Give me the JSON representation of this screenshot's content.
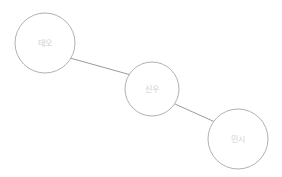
{
  "diagram": {
    "type": "node-link-graph",
    "background_color": "#ffffff",
    "node_fill": "#ffffff",
    "node_stroke": "#a8a8a8",
    "edge_color": "#8f8f8f",
    "label_color": "#cfcfcf",
    "nodes": [
      {
        "id": "node-1",
        "label": "태오",
        "cx": 45,
        "cy": 43,
        "r": 30
      },
      {
        "id": "node-2",
        "label": "신우",
        "cx": 152,
        "cy": 89,
        "r": 27
      },
      {
        "id": "node-3",
        "label": "민시",
        "cx": 238,
        "cy": 139,
        "r": 30
      }
    ],
    "edges": [
      {
        "id": "edge-1",
        "source": "태오",
        "target": "신우",
        "x1": 70,
        "y1": 58,
        "x2": 131,
        "y2": 75
      },
      {
        "id": "edge-2",
        "source": "신우",
        "target": "민시",
        "x1": 175,
        "y1": 104,
        "x2": 215,
        "y2": 122
      }
    ]
  }
}
